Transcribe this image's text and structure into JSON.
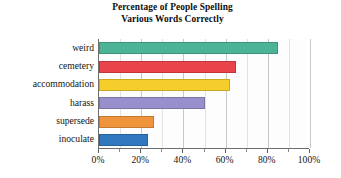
{
  "chart_data": {
    "type": "bar",
    "orientation": "horizontal",
    "title": "Percentage of People Spelling Various Words Correctly",
    "title_lines": [
      "Percentage of People Spelling",
      "Various Words Correctly"
    ],
    "xlabel": "",
    "ylabel": "",
    "xlim": [
      0,
      100
    ],
    "xticks": [
      0,
      20,
      40,
      60,
      80,
      100
    ],
    "xtick_labels": [
      "0%",
      "20%",
      "40%",
      "60%",
      "80%",
      "100%"
    ],
    "minor_tick_interval": 10,
    "grid": true,
    "grid_axis": "x",
    "legend": false,
    "legend_position": "none",
    "categories": [
      "weird",
      "cemetery",
      "accommodation",
      "harass",
      "supersede",
      "inoculate"
    ],
    "values": [
      85,
      65,
      62,
      50,
      26,
      23
    ],
    "bar_colors": [
      "#4DB396",
      "#E8444A",
      "#F5CE2C",
      "#9890CC",
      "#F0943C",
      "#3178BE"
    ],
    "bars": [
      {
        "category": "weird",
        "value": 85,
        "color": "#4DB396"
      },
      {
        "category": "cemetery",
        "value": 65,
        "color": "#E8444A"
      },
      {
        "category": "accommodation",
        "value": 62,
        "color": "#F5CE2C"
      },
      {
        "category": "harass",
        "value": 50,
        "color": "#9890CC"
      },
      {
        "category": "supersede",
        "value": 26,
        "color": "#F0943C"
      },
      {
        "category": "inoculate",
        "value": 23,
        "color": "#3178BE"
      }
    ]
  },
  "style": {
    "plot_background": "#fdfdfd",
    "page_background": "#ffffff",
    "axis_color": "#6e6e6e",
    "gridline_color": "#c8c8c8",
    "text_color": "#151515"
  }
}
